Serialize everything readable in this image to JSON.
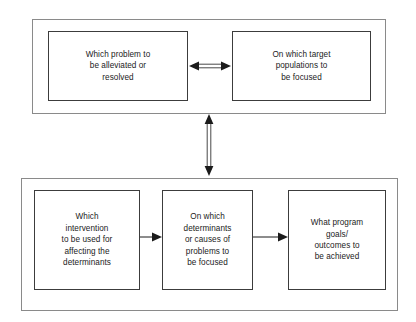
{
  "diagram": {
    "background_color": "#ffffff",
    "panel_border_color": "#8a8a8a",
    "node_border_color": "#3c3c3c",
    "connector_color": "#1b1b1b",
    "text_color": "#1b1b1b",
    "groups": [
      {
        "id": "top-panel",
        "name": "problem-and-population-group",
        "nodes": [
          {
            "id": "problem",
            "text": "Which problem to\nbe alleviated or\nresolved"
          },
          {
            "id": "target",
            "text": "On which target\npopulations to\nbe focused"
          }
        ]
      },
      {
        "id": "bottom-panel",
        "name": "intervention-determinants-goals-group",
        "nodes": [
          {
            "id": "intervention",
            "text": "Which\nintervention\nto be used for\naffecting the\ndeterminants"
          },
          {
            "id": "determinants",
            "text": "On which\ndeterminants\nor causes of\nproblems to\nbe focused"
          },
          {
            "id": "goals",
            "text": "What program\ngoals/\noutcomes to\nbe achieved"
          }
        ]
      }
    ],
    "connectors": [
      {
        "id": "problem-target",
        "name": "double-headed-arrow-horizontal",
        "from": "problem",
        "to": "target",
        "style": "double-headed",
        "orientation": "horizontal"
      },
      {
        "id": "panels-link",
        "name": "double-headed-arrow-vertical",
        "from": "top-panel",
        "to": "bottom-panel",
        "style": "double-headed",
        "orientation": "vertical"
      },
      {
        "id": "intervention-determinants",
        "name": "arrow-right",
        "from": "intervention",
        "to": "determinants",
        "style": "single-headed",
        "orientation": "horizontal"
      },
      {
        "id": "determinants-goals",
        "name": "arrow-right",
        "from": "determinants",
        "to": "goals",
        "style": "single-headed",
        "orientation": "horizontal"
      }
    ]
  }
}
